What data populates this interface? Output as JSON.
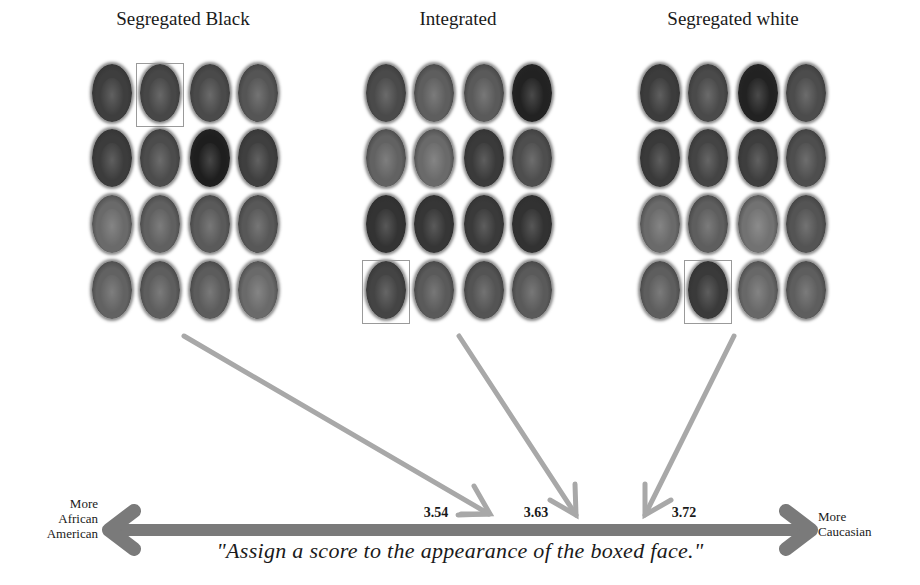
{
  "figure": {
    "panels": [
      {
        "title": "Segregated Black",
        "center_x": 183,
        "boxed_face": {
          "row": 0,
          "col": 1
        },
        "face_tones": [
          [
            "#3e3e3e",
            "#474747",
            "#4a4a4a",
            "#555555"
          ],
          [
            "#3c3c3c",
            "#4c4c4c",
            "#1e1e1e",
            "#3f3f3f"
          ],
          [
            "#6a6a6a",
            "#606060",
            "#5a5a5a",
            "#585858"
          ],
          [
            "#626262",
            "#5e5e5e",
            "#5c5c5c",
            "#6a6a6a"
          ]
        ]
      },
      {
        "title": "Integrated",
        "center_x": 458,
        "boxed_face": {
          "row": 3,
          "col": 0
        },
        "face_tones": [
          [
            "#4a4a4a",
            "#5e5e5e",
            "#5a5a5a",
            "#222222"
          ],
          [
            "#626262",
            "#6a6a6a",
            "#3a3a3a",
            "#4e4e4e"
          ],
          [
            "#333333",
            "#363636",
            "#3a3a3a",
            "#323232"
          ],
          [
            "#444444",
            "#5a5a5a",
            "#545454",
            "#5a5a5a"
          ]
        ]
      },
      {
        "title": "Segregated white",
        "center_x": 733,
        "boxed_face": {
          "row": 3,
          "col": 1
        },
        "face_tones": [
          [
            "#3c3c3c",
            "#4a4a4a",
            "#222222",
            "#4c4c4c"
          ],
          [
            "#3a3a3a",
            "#444444",
            "#3e3e3e",
            "#4e4e4e"
          ],
          [
            "#6a6a6a",
            "#5e5e5e",
            "#727272",
            "#545454"
          ],
          [
            "#5e5e5e",
            "#3a3a3a",
            "#686868",
            "#5e5e5e"
          ]
        ]
      }
    ],
    "scale": {
      "left_label": [
        "More",
        "African",
        "American"
      ],
      "right_label": [
        "More",
        "Caucasian"
      ],
      "values": [
        {
          "label": "3.54",
          "panel": "Segregated Black",
          "x": 436,
          "tip_x": 490
        },
        {
          "label": "3.63",
          "panel": "Integrated",
          "x": 536,
          "tip_x": 576
        },
        {
          "label": "3.72",
          "panel": "Segregated white",
          "x": 684,
          "tip_x": 645
        }
      ],
      "caption": "\"Assign a score to the appearance of the boxed face.\""
    },
    "colors": {
      "scale_arrow": "#7a7a7a",
      "pointer_arrow": "#a8a8a8",
      "box_border": "#9a9a9a",
      "text": "#1a1a1a"
    }
  }
}
